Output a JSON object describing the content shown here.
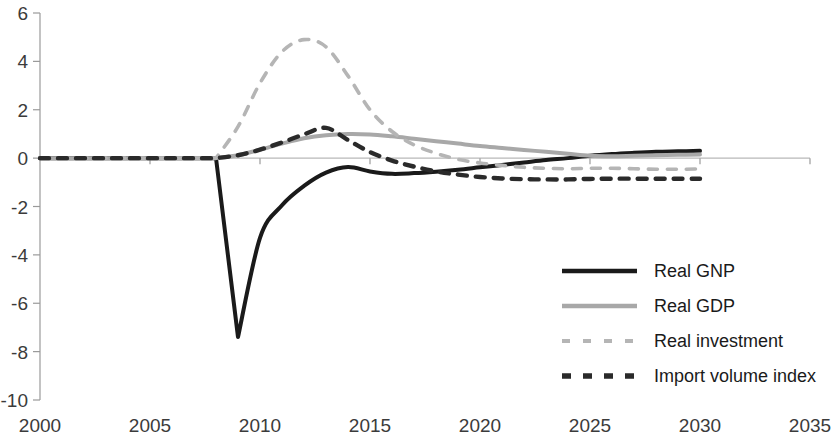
{
  "chart_data": {
    "type": "line",
    "title": "",
    "subtitle": "",
    "xlabel": "",
    "ylabel": "",
    "xlim": [
      2000,
      2035
    ],
    "ylim": [
      -10,
      6
    ],
    "xticks": [
      2000,
      2005,
      2010,
      2015,
      2020,
      2025,
      2030,
      2035
    ],
    "yticks": [
      6,
      4,
      2,
      0,
      -2,
      -4,
      -6,
      -8,
      -10
    ],
    "grid": false,
    "legend_position": "inside-lower-right",
    "x": [
      2000,
      2001,
      2002,
      2003,
      2004,
      2005,
      2006,
      2007,
      2008,
      2009,
      2010,
      2011,
      2012,
      2013,
      2014,
      2015,
      2016,
      2017,
      2018,
      2019,
      2020,
      2021,
      2022,
      2023,
      2024,
      2025,
      2026,
      2027,
      2028,
      2029,
      2030
    ],
    "series": [
      {
        "name": "Real GNP",
        "color": "#1a1a1a",
        "style": "solid",
        "width": 4.0,
        "values": [
          0,
          0,
          0,
          0,
          0,
          0,
          0,
          0,
          0,
          -7.4,
          -3.3,
          -1.95,
          -1.15,
          -0.6,
          -0.37,
          -0.55,
          -0.65,
          -0.62,
          -0.56,
          -0.48,
          -0.38,
          -0.28,
          -0.18,
          -0.08,
          0.0,
          0.1,
          0.17,
          0.22,
          0.26,
          0.28,
          0.3
        ]
      },
      {
        "name": "Real GDP",
        "color": "#a8a8a8",
        "style": "solid",
        "width": 4.0,
        "values": [
          0,
          0,
          0,
          0,
          0,
          0,
          0,
          0,
          0,
          0.12,
          0.35,
          0.6,
          0.82,
          0.95,
          1.0,
          0.98,
          0.9,
          0.8,
          0.7,
          0.6,
          0.5,
          0.42,
          0.34,
          0.26,
          0.18,
          0.1,
          0.08,
          0.1,
          0.12,
          0.14,
          0.15
        ]
      },
      {
        "name": "Real investment",
        "color": "#b5b5b5",
        "style": "dashed",
        "width": 3.6,
        "values": [
          0,
          0,
          0,
          0,
          0,
          0,
          0,
          0,
          0,
          1.3,
          3.1,
          4.4,
          4.9,
          4.6,
          3.4,
          2.0,
          1.1,
          0.55,
          0.2,
          -0.05,
          -0.2,
          -0.3,
          -0.38,
          -0.42,
          -0.44,
          -0.42,
          -0.42,
          -0.44,
          -0.46,
          -0.46,
          -0.45
        ]
      },
      {
        "name": "Import volume index",
        "color": "#2a2a2a",
        "style": "dashed",
        "width": 4.4,
        "values": [
          0,
          0,
          0,
          0,
          0,
          0,
          0,
          0,
          0,
          0.12,
          0.35,
          0.65,
          0.98,
          1.25,
          0.75,
          0.25,
          -0.1,
          -0.35,
          -0.55,
          -0.68,
          -0.78,
          -0.84,
          -0.87,
          -0.88,
          -0.88,
          -0.86,
          -0.85,
          -0.85,
          -0.85,
          -0.85,
          -0.85
        ]
      }
    ],
    "legend": [
      {
        "label": "Real GNP",
        "color": "#1a1a1a",
        "style": "solid"
      },
      {
        "label": "Real GDP",
        "color": "#a8a8a8",
        "style": "solid"
      },
      {
        "label": "Real investment",
        "color": "#b5b5b5",
        "style": "dashed"
      },
      {
        "label": "Import volume index",
        "color": "#2a2a2a",
        "style": "dashed"
      }
    ]
  },
  "axis": {
    "y_tick_labels": [
      "6",
      "4",
      "2",
      "0",
      "-2",
      "-4",
      "-6",
      "-8",
      "-10"
    ],
    "x_tick_labels": [
      "2000",
      "2005",
      "2010",
      "2015",
      "2020",
      "2025",
      "2030",
      "2035"
    ]
  }
}
